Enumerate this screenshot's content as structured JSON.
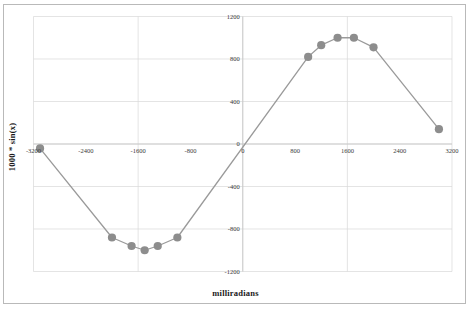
{
  "chart_data": {
    "type": "line",
    "title": "",
    "xlabel": "milliradians",
    "ylabel": "1000 * sin(x)",
    "xlim": [
      -3200,
      3200
    ],
    "ylim": [
      -1200,
      1200
    ],
    "grid": true,
    "legend": false,
    "marker": "circle",
    "line_color": "#9a9a9a",
    "marker_color": "#8d8d8d",
    "gridline_color": "#d9d9d9",
    "xticks": [
      -3200,
      -2400,
      -1600,
      -800,
      0,
      800,
      1600,
      2400,
      3200
    ],
    "xtick_labels": [
      "-3200",
      "-2400",
      "-1600",
      "-800",
      "0",
      "800",
      "1600",
      "2400",
      "3200"
    ],
    "yticks": [
      1200,
      800,
      400,
      0,
      -400,
      -800,
      -1200
    ],
    "ytick_labels": [
      "1200",
      "800",
      "400",
      "0",
      "-400",
      "-800",
      "-1200"
    ],
    "x": [
      -3100,
      -2000,
      -1700,
      -1500,
      -1300,
      -1000,
      1000,
      1200,
      1450,
      1700,
      2000,
      3000
    ],
    "y": [
      -42,
      -880,
      -960,
      -1000,
      -960,
      -880,
      820,
      930,
      1000,
      1000,
      910,
      140
    ],
    "points": [
      {
        "x": -3100,
        "y": -42
      },
      {
        "x": -2000,
        "y": -880
      },
      {
        "x": -1700,
        "y": -960
      },
      {
        "x": -1500,
        "y": -1000
      },
      {
        "x": -1300,
        "y": -960
      },
      {
        "x": -1000,
        "y": -880
      },
      {
        "x": 1000,
        "y": 820
      },
      {
        "x": 1200,
        "y": 930
      },
      {
        "x": 1450,
        "y": 1000
      },
      {
        "x": 1700,
        "y": 1000
      },
      {
        "x": 2000,
        "y": 910
      },
      {
        "x": 3000,
        "y": 140
      }
    ]
  },
  "axes": {
    "x_title": "milliradians",
    "y_title": "1000 * sin(x)"
  }
}
